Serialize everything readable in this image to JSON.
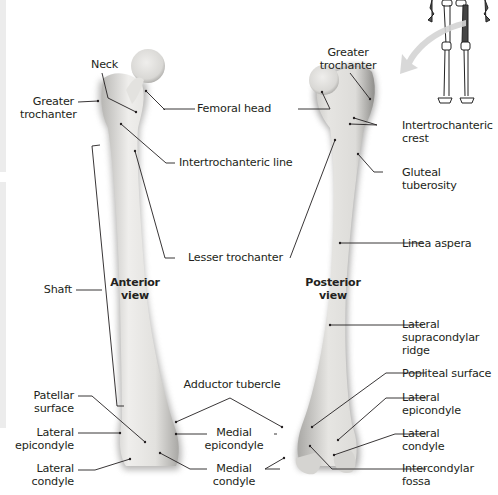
{
  "figure": {
    "colors": {
      "bone_fill": "#e7e6e3",
      "bone_shadow": "#8f8e8c",
      "leader_line": "#231f20",
      "label_text": "#231f20",
      "arrow": "#d4d4d4",
      "edge_bar": "#ececec"
    }
  },
  "views": {
    "anterior": {
      "line1": "Anterior",
      "line2": "view"
    },
    "posterior": {
      "line1": "Posterior",
      "line2": "view"
    }
  },
  "anterior_labels": {
    "neck": "Neck",
    "greater_trochanter": {
      "line1": "Greater",
      "line2": "trochanter"
    },
    "femoral_head": "Femoral head",
    "intertrochanteric_line": "Intertrochanteric line",
    "lesser_trochanter": "Lesser trochanter",
    "shaft": "Shaft",
    "adductor_tubercle": "Adductor tubercle",
    "patellar_surface": {
      "line1": "Patellar",
      "line2": "surface"
    },
    "lateral_epicondyle": {
      "line1": "Lateral",
      "line2": "epicondyle"
    },
    "lateral_condyle": {
      "line1": "Lateral",
      "line2": "condyle"
    },
    "medial_epicondyle": {
      "line1": "Medial",
      "line2": "epicondyle"
    },
    "medial_condyle": {
      "line1": "Medial",
      "line2": "condyle"
    }
  },
  "posterior_labels": {
    "greater_trochanter": {
      "line1": "Greater",
      "line2": "trochanter"
    },
    "intertrochanteric_crest": {
      "line1": "Intertrochanteric",
      "line2": "crest"
    },
    "gluteal_tuberosity": {
      "line1": "Gluteal",
      "line2": "tuberosity"
    },
    "linea_aspera": "Linea aspera",
    "lateral_supracondylar_ridge": {
      "line1": "Lateral",
      "line2": "supracondylar",
      "line3": "ridge"
    },
    "popliteal_surface": "Popliteal surface",
    "lateral_epicondyle": {
      "line1": "Lateral",
      "line2": "epicondyle"
    },
    "lateral_condyle": {
      "line1": "Lateral",
      "line2": "condyle"
    },
    "intercondylar_fossa": {
      "line1": "Intercondylar",
      "line2": "fossa"
    }
  },
  "locator_icon": "skeleton-with-highlighted-femur-icon"
}
